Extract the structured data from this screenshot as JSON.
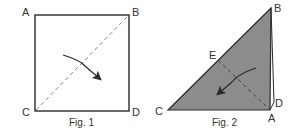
{
  "figures": [
    {
      "caption": "Fig. 1",
      "labels": {
        "A": "A",
        "B": "B",
        "C": "C",
        "D": "D"
      },
      "description": "Square ABCD with dashed diagonal from C to B and a curved arrow indicating fold"
    },
    {
      "caption": "Fig. 2",
      "labels": {
        "B": "B",
        "C": "C",
        "D": "D",
        "A": "A",
        "E": "E"
      },
      "description": "Shaded right triangle CBA with dashed fold line from E to A and curved arrow pointing toward C"
    }
  ],
  "colors": {
    "line": "#2a2a2a",
    "fill": "#8c8c8c",
    "dash": "#777777"
  }
}
